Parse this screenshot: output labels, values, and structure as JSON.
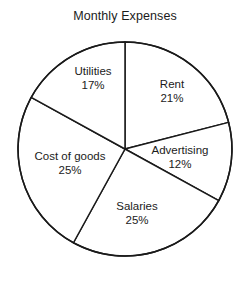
{
  "chart_data": {
    "type": "pie",
    "title": "Monthly Expenses",
    "xlabel": "",
    "ylabel": "",
    "grid": false,
    "legend": "none",
    "labels_inside": true,
    "start_angle_deg": 0,
    "direction": "clockwise",
    "categories": [
      "Rent",
      "Advertising",
      "Salaries",
      "Cost of goods",
      "Utilities"
    ],
    "values": [
      21,
      12,
      25,
      25,
      17
    ],
    "value_unit": "%",
    "slices": [
      {
        "name": "Rent",
        "value": 21,
        "pct_label": "21%",
        "label_x": 172,
        "label_y": 91,
        "start_deg": 0.0,
        "end_deg": 75.6
      },
      {
        "name": "Advertising",
        "value": 12,
        "pct_label": "12%",
        "label_y": 157,
        "label_x": 180,
        "start_deg": 75.6,
        "end_deg": 118.8
      },
      {
        "name": "Salaries",
        "value": 25,
        "pct_label": "25%",
        "label_x": 137,
        "label_y": 213,
        "start_deg": 118.8,
        "end_deg": 208.8
      },
      {
        "name": "Cost of goods",
        "value": 25,
        "pct_label": "25%",
        "label_x": 70,
        "label_y": 163,
        "start_deg": 208.8,
        "end_deg": 298.8
      },
      {
        "name": "Utilities",
        "value": 17,
        "pct_label": "17%",
        "label_x": 93,
        "label_y": 78,
        "start_deg": 298.8,
        "end_deg": 360.0
      }
    ],
    "geometry": {
      "cx": 125,
      "cy": 149,
      "r": 107
    },
    "colors": {
      "background": "#ffffff",
      "slice_fill": "#ffffff",
      "stroke": "#1a1a1a",
      "text": "#1b1b1b"
    },
    "stroke_width": 1.5
  }
}
